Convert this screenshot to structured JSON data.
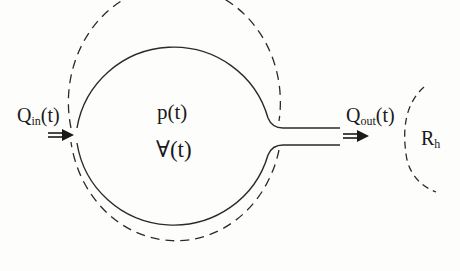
{
  "diagram": {
    "type": "compliance-chamber-schematic",
    "labels": {
      "inflow_main": "Q",
      "inflow_sub": "in",
      "inflow_arg": "(t)",
      "outflow_main": "Q",
      "outflow_sub": "out",
      "outflow_arg": "(t)",
      "pressure": "p(t)",
      "volume": "∀(t)",
      "resistance_main": "R",
      "resistance_sub": "h"
    },
    "elements": [
      {
        "id": "chamber-solid",
        "kind": "circle-solid",
        "meaning": "chamber wall at rest"
      },
      {
        "id": "chamber-dashed",
        "kind": "circle-dashed",
        "meaning": "expanded chamber wall"
      },
      {
        "id": "outlet-tube",
        "kind": "neck",
        "meaning": "outflow tube"
      },
      {
        "id": "inflow-arrow",
        "kind": "double-arrow",
        "direction": "right"
      },
      {
        "id": "outflow-arrow",
        "kind": "double-arrow",
        "direction": "right"
      },
      {
        "id": "resistance-arc",
        "kind": "dashed-arc",
        "meaning": "hydraulic resistance"
      }
    ],
    "colors": {
      "stroke": "#2a2a2a",
      "background": "#fdfdfc"
    }
  }
}
